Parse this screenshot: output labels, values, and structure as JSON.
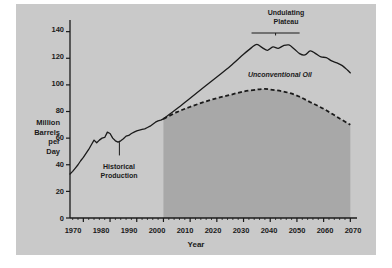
{
  "figure": {
    "background": "#c9c9c9",
    "ink": "#1a1a1a",
    "shade_fill": "#a8a8a8"
  },
  "axes": {
    "ylabel_lines": [
      "Million",
      "Barrels",
      "per",
      "Day"
    ],
    "ylabel_line1": "Million",
    "ylabel_line2": "Barrels",
    "ylabel_line3": "per",
    "ylabel_line4": "Day",
    "xlabel": "Year",
    "yticks": [
      0,
      20,
      40,
      60,
      80,
      100,
      120,
      140
    ],
    "ytick_labels": [
      "0",
      "20",
      "40",
      "60",
      "80",
      "100",
      "120",
      "140"
    ],
    "xticks": [
      1970,
      1980,
      1990,
      2000,
      2010,
      2020,
      2030,
      2040,
      2050,
      2060,
      2070
    ],
    "xtick_labels": [
      "1970",
      "1980",
      "1990",
      "2000",
      "2010",
      "2020",
      "2030",
      "2040",
      "2050",
      "2060",
      "2070"
    ],
    "xlim": [
      1965,
      2071
    ],
    "ylim": [
      0,
      148
    ]
  },
  "annotations": {
    "undulating_plateau_line1": "Undulating",
    "undulating_plateau_line2": "Plateau",
    "historical_line1": "Historical",
    "historical_line2": "Production",
    "unconventional_oil": "Unconventional Oil",
    "conventional_oil": "Conventional Oil"
  },
  "chart_data": {
    "type": "line",
    "title": "",
    "xlabel": "Year",
    "ylabel": "Million Barrels per Day",
    "xlim": [
      1965,
      2071
    ],
    "ylim": [
      0,
      148
    ],
    "grid": false,
    "legend": "inline-annotations",
    "shaded_region": {
      "label": "Conventional Oil",
      "x_start": 2000,
      "x_end": 2070,
      "fill": "#a8a8a8",
      "baseline": 0
    },
    "series": [
      {
        "name": "Historical Production",
        "style": "solid",
        "x": [
          1965,
          1966,
          1967,
          1968,
          1969,
          1970,
          1971,
          1972,
          1973,
          1974,
          1975,
          1976,
          1977,
          1978,
          1979,
          1980,
          1981,
          1982,
          1983,
          1984,
          1985,
          1986,
          1987,
          1988,
          1989,
          1990,
          1991,
          1992,
          1993,
          1994,
          1995,
          1996,
          1997,
          1998,
          1999,
          2000
        ],
        "values": [
          33,
          35,
          37.5,
          40,
          43,
          45.5,
          48.5,
          51.5,
          55,
          58.5,
          56.5,
          58.5,
          60,
          60.5,
          64.5,
          63.5,
          60,
          58,
          57,
          58,
          59.5,
          61.5,
          62,
          63.5,
          64.5,
          65.5,
          66,
          66.5,
          67,
          68,
          69,
          70.5,
          72,
          73,
          73.5,
          74.5
        ]
      },
      {
        "name": "Unconventional Oil",
        "style": "solid",
        "x": [
          2000,
          2005,
          2010,
          2015,
          2020,
          2025,
          2030,
          2033,
          2035,
          2037,
          2039,
          2041,
          2043,
          2045,
          2047,
          2049,
          2051,
          2053,
          2055,
          2057,
          2059,
          2061,
          2063,
          2065,
          2067,
          2069,
          2070
        ],
        "values": [
          74.5,
          82,
          90,
          98,
          106,
          114,
          123,
          128,
          130.5,
          128,
          126,
          128.5,
          127.5,
          129.5,
          130,
          127,
          123.5,
          122.5,
          125.5,
          123.5,
          121,
          120.5,
          118,
          116.5,
          114.5,
          111,
          109
        ]
      },
      {
        "name": "Conventional Oil",
        "style": "dashed",
        "x": [
          2000,
          2005,
          2010,
          2015,
          2020,
          2025,
          2030,
          2035,
          2038,
          2040,
          2045,
          2050,
          2055,
          2060,
          2065,
          2070
        ],
        "values": [
          74.5,
          79.5,
          83.5,
          87,
          90,
          92.5,
          95,
          96.5,
          97,
          96.5,
          95,
          92,
          87,
          82,
          76,
          70
        ]
      }
    ],
    "notes": [
      {
        "text": "Undulating Plateau",
        "x_range": [
          2033,
          2051
        ],
        "y": 139
      },
      {
        "text": "Unconventional Oil",
        "x": 2038,
        "y": 111
      },
      {
        "text": "Conventional Oil",
        "x": 2034,
        "y": 77
      },
      {
        "text": "Historical Production",
        "x": 1984,
        "y": 42
      }
    ]
  }
}
